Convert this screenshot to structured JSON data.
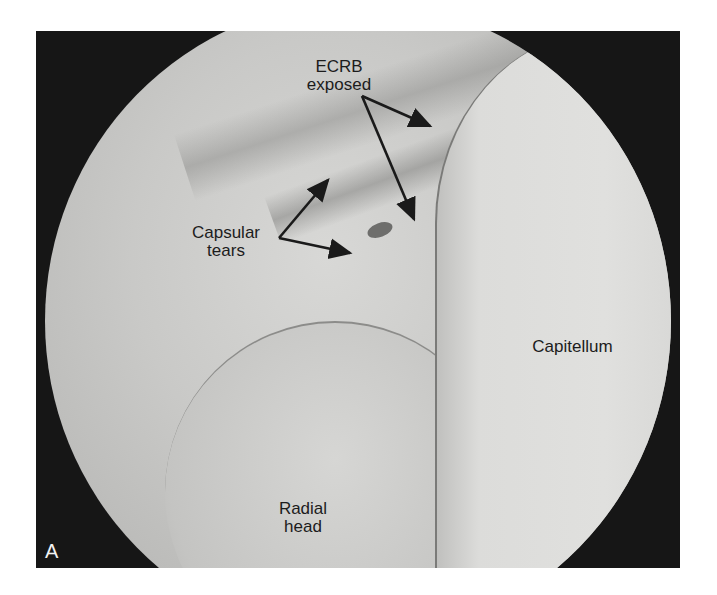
{
  "figure": {
    "panel_label": "A",
    "labels": {
      "ecrb": [
        "ECRB",
        "exposed"
      ],
      "capsular": [
        "Capsular",
        "tears"
      ],
      "capitellum": "Capitellum",
      "radial_head": [
        "Radial",
        "head"
      ]
    }
  }
}
